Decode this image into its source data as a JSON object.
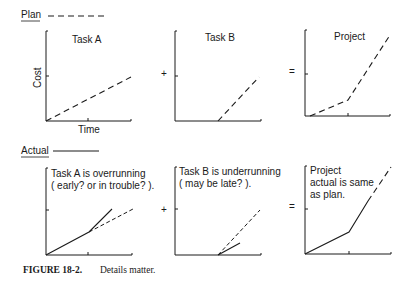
{
  "legend": {
    "plan_label": "Plan",
    "actual_label": "Actual"
  },
  "operators": {
    "plus": "+",
    "equals": "="
  },
  "axes": {
    "ylabel": "Cost",
    "xlabel": "Time"
  },
  "plan_row": {
    "task_a": {
      "title": "Task A"
    },
    "task_b": {
      "title": "Task B"
    },
    "project": {
      "title": "Project"
    }
  },
  "actual_row": {
    "task_a": {
      "line1": "Task A is overrunning",
      "line2": "( early? or in trouble? )."
    },
    "task_b": {
      "line1": "Task B is underrunning",
      "line2": "( may be late? )."
    },
    "project": {
      "line1": "Project",
      "line2": "actual is same",
      "line3": "as plan."
    }
  },
  "caption": {
    "label": "FIGURE 18-2.",
    "text": "Details matter."
  }
}
